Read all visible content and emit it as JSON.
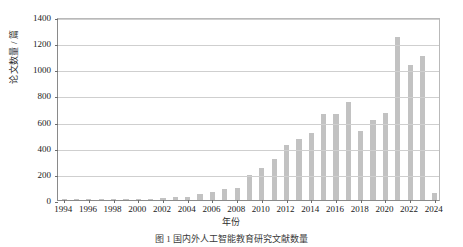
{
  "chart_data": {
    "type": "bar",
    "title": "",
    "xlabel": "年份",
    "ylabel": "论文数量 / 篇",
    "ylim": [
      0,
      1400
    ],
    "ytick_values": [
      0,
      200,
      400,
      600,
      800,
      1000,
      1200,
      1400
    ],
    "ytick_labels": [
      "0",
      "200",
      "400",
      "600",
      "800",
      "1000",
      "1200",
      "1400"
    ],
    "xtick_labels": [
      "1994",
      "1996",
      "1998",
      "2000",
      "2002",
      "2004",
      "2006",
      "2008",
      "2010",
      "2012",
      "2014",
      "2016",
      "2018",
      "2020",
      "2022",
      "2024"
    ],
    "grid": "horizontal",
    "legend": "none",
    "bar_color": "#c2c2c2",
    "categories": [
      1994,
      1995,
      1996,
      1997,
      1998,
      1999,
      2000,
      2001,
      2002,
      2003,
      2004,
      2005,
      2006,
      2007,
      2008,
      2009,
      2010,
      2011,
      2012,
      2013,
      2014,
      2015,
      2016,
      2017,
      2018,
      2019,
      2020,
      2021,
      2022,
      2023,
      2024
    ],
    "values": [
      2,
      2,
      3,
      3,
      4,
      5,
      6,
      8,
      14,
      20,
      22,
      45,
      60,
      85,
      95,
      190,
      245,
      310,
      420,
      465,
      510,
      660,
      655,
      750,
      525,
      610,
      665,
      1250,
      1030,
      1100,
      50
    ]
  },
  "figure": {
    "caption": "图 1    国内外人工智能教育研究文献数量"
  }
}
